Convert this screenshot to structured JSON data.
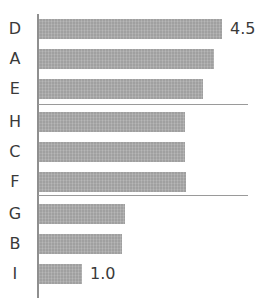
{
  "chart_data": {
    "type": "bar",
    "orientation": "horizontal",
    "title": "",
    "subtitle": "",
    "xlabel": "",
    "ylabel": "",
    "grid": false,
    "legend": null,
    "legend_position": "none",
    "xlim": [
      0,
      4.5
    ],
    "axis_origin": 0,
    "categories": [
      "D",
      "A",
      "E",
      "H",
      "C",
      "F",
      "G",
      "B",
      "I"
    ],
    "values": [
      4.5,
      4.3,
      4.0,
      3.6,
      3.6,
      3.65,
      2.15,
      2.05,
      1.0
    ],
    "tick_labels": [],
    "annotations": [
      {
        "category": "D",
        "text": "4.5",
        "position": "end-of-bar"
      },
      {
        "category": "I",
        "text": "1.0",
        "position": "end-of-bar"
      }
    ],
    "group_separators_after": [
      "E",
      "F"
    ],
    "bar_color": "#a9a9a9",
    "axis_color": "#8f8f8f",
    "rule_color": "#9a9a9a",
    "label_color": "#3a3a3a",
    "background_color": "#ffffff"
  },
  "rows": [
    {
      "label": "D",
      "value": 4.5,
      "value_label": "4.5",
      "bar_px": 183
    },
    {
      "label": "A",
      "value": 4.3,
      "value_label": "",
      "bar_px": 175
    },
    {
      "label": "E",
      "value": 4.0,
      "value_label": "",
      "bar_px": 164
    },
    {
      "label": "H",
      "value": 3.6,
      "value_label": "",
      "bar_px": 146
    },
    {
      "label": "C",
      "value": 3.6,
      "value_label": "",
      "bar_px": 146
    },
    {
      "label": "F",
      "value": 3.65,
      "value_label": "",
      "bar_px": 147
    },
    {
      "label": "G",
      "value": 2.15,
      "value_label": "",
      "bar_px": 86
    },
    {
      "label": "B",
      "value": 2.05,
      "value_label": "",
      "bar_px": 83
    },
    {
      "label": "I",
      "value": 1.0,
      "value_label": "1.0",
      "bar_px": 43
    }
  ],
  "layout": {
    "row_tops": [
      14,
      44,
      74,
      107,
      137,
      167,
      199,
      229,
      259
    ],
    "rule_tops": [
      104,
      195
    ],
    "rule_width": 210
  }
}
